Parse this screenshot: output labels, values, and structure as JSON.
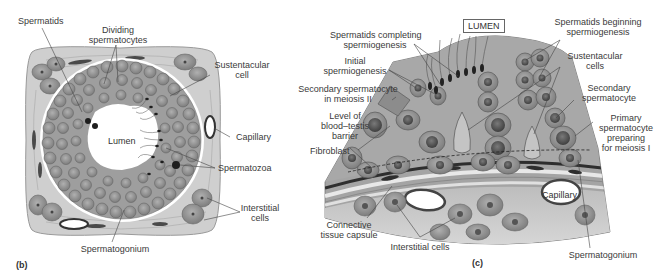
{
  "figure": {
    "panels": [
      {
        "id": "b",
        "letter": "(b)",
        "title": "Seminiferous tubule cross-section",
        "labels": {
          "spermatids": "Spermatids",
          "dividing_spermatocytes_1": "Dividing",
          "dividing_spermatocytes_2": "spermatocytes",
          "sustentacular_cell_1": "Sustentacular",
          "sustentacular_cell_2": "cell",
          "capillary": "Capillary",
          "lumen": "Lumen",
          "spermatozoa": "Spermatozoa",
          "interstitial_cells_1": "Interstitial",
          "interstitial_cells_2": "cells",
          "spermatogonium": "Spermatogonium"
        }
      },
      {
        "id": "c",
        "letter": "(c)",
        "title": "Seminiferous epithelium detail",
        "labels": {
          "lumen_box": "LUMEN",
          "spermatids_completing_1": "Spermatids completing",
          "spermatids_completing_2": "spermiogenesis",
          "initial_spermiogenesis_1": "Initial",
          "initial_spermiogenesis_2": "spermiogenesis",
          "secondary_meiosis_1": "Secondary spermatocyte",
          "secondary_meiosis_2": "in meiosis II",
          "blood_testis_1": "Level of",
          "blood_testis_2": "blood–testis",
          "blood_testis_3": "barrier",
          "fibroblast": "Fibroblast",
          "connective_1": "Connective",
          "connective_2": "tissue capsule",
          "interstitial_cells": "Interstitial cells",
          "spermatids_beginning_1": "Spermatids beginning",
          "spermatids_beginning_2": "spermiogenesis",
          "sustentacular_cells_1": "Sustentacular",
          "sustentacular_cells_2": "cells",
          "secondary_spermatocyte_1": "Secondary",
          "secondary_spermatocyte_2": "spermatocyte",
          "primary_1": "Primary",
          "primary_2": "spermatocyte",
          "primary_3": "preparing",
          "primary_4": "for meiosis I",
          "capillary": "Capillary",
          "spermatogonium": "Spermatogonium"
        }
      }
    ],
    "colors": {
      "background": "#ffffff",
      "connective_tissue": "#c9c9c9",
      "epithelium": "#a9a9a9",
      "cell_fill": "#8f8f8f",
      "nucleus": "#5a5a5a",
      "lumen": "#ffffff",
      "leader_line": "#444444",
      "label_text": "#3a3a3a"
    }
  }
}
